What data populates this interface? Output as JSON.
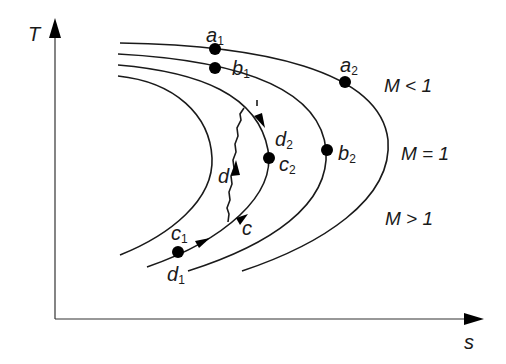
{
  "diagram": {
    "type": "T-s diagram (Fanno / Rayleigh lines)",
    "axes": {
      "y_label": "T",
      "x_label": "s"
    },
    "curves": [
      {
        "id": "curve-1",
        "description": "innermost line"
      },
      {
        "id": "curve-2",
        "description": "line containing c1-c-c2"
      },
      {
        "id": "curve-3",
        "description": "line containing b1-b2"
      },
      {
        "id": "curve-4",
        "description": "outermost line containing a1-a2"
      }
    ],
    "points": {
      "a1": {
        "label": "a",
        "sub": "1"
      },
      "a2": {
        "label": "a",
        "sub": "2"
      },
      "b1": {
        "label": "b",
        "sub": "1"
      },
      "b2": {
        "label": "b",
        "sub": "2"
      },
      "c1": {
        "label": "c",
        "sub": "1"
      },
      "c2": {
        "label": "c",
        "sub": "2"
      },
      "d1": {
        "label": "d",
        "sub": "1"
      },
      "d2": {
        "label": "d",
        "sub": "2"
      }
    },
    "path_labels": {
      "c": "c",
      "d": "d"
    },
    "regions": {
      "subsonic": "M < 1",
      "sonic": "M = 1",
      "supersonic": "M > 1"
    },
    "colors": {
      "line": "#1a1a1a",
      "background": "#ffffff"
    }
  }
}
